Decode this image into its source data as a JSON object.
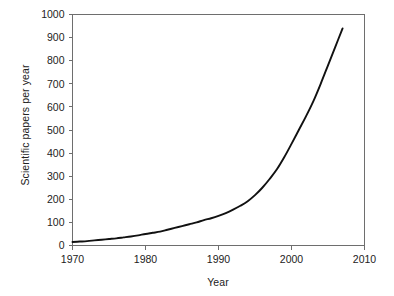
{
  "chart_data": {
    "type": "line",
    "title": "",
    "xlabel": "Year",
    "ylabel": "Scientific papers per year",
    "xlim": [
      1970,
      2010
    ],
    "ylim": [
      0,
      1000
    ],
    "xticks": [
      1970,
      1980,
      1990,
      2000,
      2010
    ],
    "yticks": [
      0,
      100,
      200,
      300,
      400,
      500,
      600,
      700,
      800,
      900,
      1000
    ],
    "grid": false,
    "legend": null,
    "series": [
      {
        "name": "Scientific papers per year",
        "color": "#111111",
        "x": [
          1970,
          1971,
          1972,
          1973,
          1974,
          1975,
          1976,
          1977,
          1978,
          1979,
          1980,
          1981,
          1982,
          1983,
          1984,
          1985,
          1986,
          1987,
          1988,
          1989,
          1990,
          1991,
          1992,
          1993,
          1994,
          1995,
          1996,
          1997,
          1998,
          1999,
          2000,
          2001,
          2002,
          2003,
          2004,
          2005,
          2006,
          2007
        ],
        "values": [
          15,
          17,
          19,
          22,
          25,
          28,
          31,
          35,
          39,
          44,
          50,
          55,
          60,
          68,
          76,
          84,
          92,
          100,
          110,
          118,
          128,
          140,
          155,
          172,
          192,
          218,
          250,
          288,
          330,
          382,
          440,
          500,
          560,
          625,
          700,
          780,
          860,
          940
        ]
      }
    ],
    "axis_tick_labels": {
      "x": [
        "1970",
        "1980",
        "1990",
        "2000",
        "2010"
      ],
      "y": [
        "0",
        "100",
        "200",
        "300",
        "400",
        "500",
        "600",
        "700",
        "800",
        "900",
        "1000"
      ]
    }
  }
}
